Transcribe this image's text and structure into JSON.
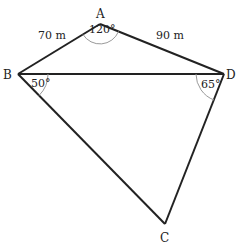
{
  "diagram": {
    "type": "quadrilateral",
    "vertices": {
      "A": {
        "label": "A"
      },
      "B": {
        "label": "B"
      },
      "C": {
        "label": "C"
      },
      "D": {
        "label": "D"
      }
    },
    "sides": {
      "AB": {
        "label": "70 m"
      },
      "AD": {
        "label": "90 m"
      }
    },
    "angles": {
      "A": {
        "label": "120°"
      },
      "B": {
        "label": "50°"
      },
      "D": {
        "label": "65°"
      }
    },
    "diagonal": "BD",
    "colors": {
      "line": "#222222",
      "arc": "#9a9a9a"
    }
  }
}
